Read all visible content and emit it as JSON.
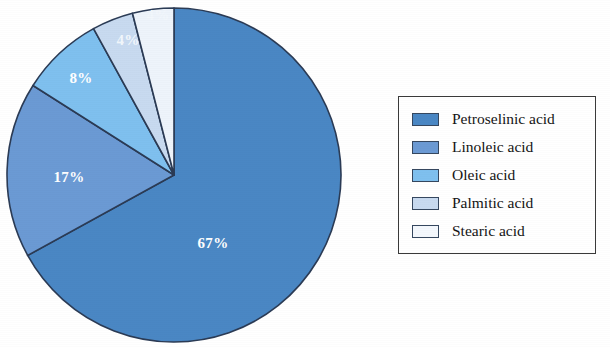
{
  "figure": {
    "background_color": "#ffffff",
    "width": 610,
    "height": 347
  },
  "chart_data": {
    "type": "pie",
    "title": "",
    "subtitle": "",
    "xlabel": "",
    "ylabel": "",
    "grid": false,
    "legend_position": "right",
    "start_angle_deg": 0,
    "direction": "clockwise",
    "center": {
      "x": 174,
      "y": 175
    },
    "radius": 167,
    "categories": [
      "Petroselinic acid",
      "Linoleic acid",
      "Oleic acid",
      "Palmitic acid",
      "Stearic acid"
    ],
    "values": [
      67,
      17,
      8,
      4,
      4
    ],
    "value_unit": "%",
    "data_labels": [
      "67%",
      "17%",
      "8%",
      "4%",
      "4%"
    ],
    "colors": [
      "#4a87c4",
      "#6b9ad4",
      "#7fc0ef",
      "#c8daf0",
      "#eef4fb"
    ],
    "slice_border_color": "#2b3b55",
    "slices": [
      {
        "label": "Petroselinic acid",
        "value": 67,
        "data_label": "67%",
        "color": "#4a87c4",
        "label_x": 213,
        "label_y": 245,
        "label_style": "light"
      },
      {
        "label": "Linoleic acid",
        "value": 17,
        "data_label": "17%",
        "color": "#6b9ad4",
        "label_x": 69,
        "label_y": 179,
        "label_style": "light"
      },
      {
        "label": "Oleic acid",
        "value": 8,
        "data_label": "8%",
        "color": "#7fc0ef",
        "label_x": 81,
        "label_y": 80,
        "label_style": "light"
      },
      {
        "label": "Palmitic acid",
        "value": 4,
        "data_label": "4%",
        "color": "#c8daf0",
        "label_x": 128,
        "label_y": 42,
        "label_style": "dim"
      },
      {
        "label": "Stearic acid",
        "value": 4,
        "data_label": "4%",
        "color": "#eef4fb",
        "label_x": 158,
        "label_y": 17,
        "label_style": "dim"
      }
    ]
  },
  "legend": {
    "items": [
      {
        "label": "Petroselinic acid",
        "color": "#4a87c4"
      },
      {
        "label": "Linoleic acid",
        "color": "#6b9ad4"
      },
      {
        "label": "Oleic acid",
        "color": "#7fc0ef"
      },
      {
        "label": "Palmitic acid",
        "color": "#c8daf0"
      },
      {
        "label": "Stearic acid",
        "color": "#f4f8fd"
      }
    ]
  }
}
